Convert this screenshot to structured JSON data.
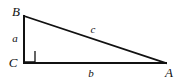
{
  "figure": {
    "kind": "right-triangle-diagram",
    "background_color": "#ffffff",
    "stroke_color": "#111111",
    "width": 177,
    "height": 83,
    "vertices": [
      {
        "id": "B",
        "label": "B",
        "x": 24,
        "y": 16,
        "label_x": 16,
        "label_y": 11
      },
      {
        "id": "C",
        "label": "C",
        "x": 24,
        "y": 63,
        "label_x": 13,
        "label_y": 62
      },
      {
        "id": "A",
        "label": "A",
        "x": 166,
        "y": 63,
        "label_x": 169,
        "label_y": 72
      }
    ],
    "sides": [
      {
        "id": "a",
        "label": "a",
        "from": "B",
        "to": "C",
        "role": "vertical-leg",
        "label_x": 15,
        "label_y": 38
      },
      {
        "id": "b",
        "label": "b",
        "from": "C",
        "to": "A",
        "role": "horizontal-leg",
        "label_x": 91,
        "label_y": 73
      },
      {
        "id": "c",
        "label": "c",
        "from": "B",
        "to": "A",
        "role": "hypotenuse",
        "label_x": 93,
        "label_y": 29
      }
    ],
    "right_angle": {
      "at_vertex": "C",
      "marker": "square",
      "x": 24,
      "y": 51,
      "size": 11
    }
  }
}
